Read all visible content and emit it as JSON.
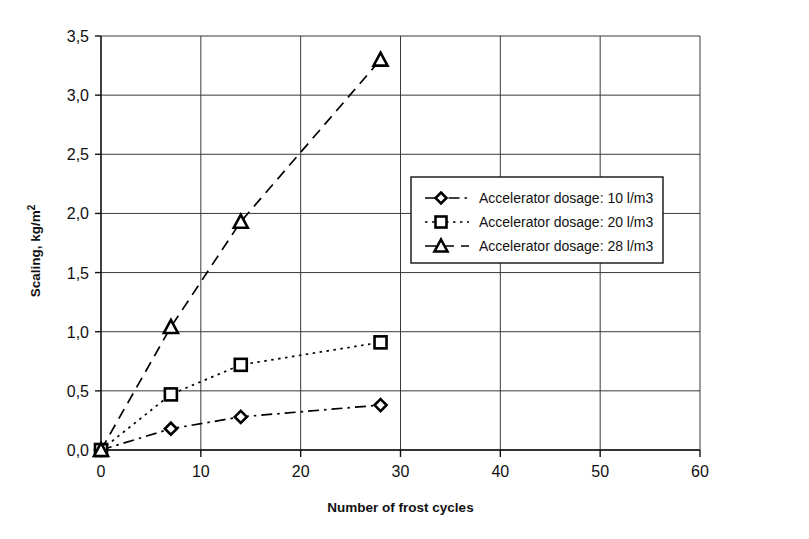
{
  "chart_data": {
    "type": "line",
    "title": "",
    "xlabel": "Number of frost cycles",
    "ylabel": "Scaling, kg/m2",
    "ylabel_display": "Scaling, kg/m",
    "ylabel_superscript": "2",
    "xlim": [
      0,
      60
    ],
    "ylim": [
      0.0,
      3.5
    ],
    "xticks": [
      0,
      10,
      20,
      30,
      40,
      50,
      60
    ],
    "xtick_labels": [
      "0",
      "10",
      "20",
      "30",
      "40",
      "50",
      "60"
    ],
    "yticks": [
      0.0,
      0.5,
      1.0,
      1.5,
      2.0,
      2.5,
      3.0,
      3.5
    ],
    "ytick_labels": [
      "0,0",
      "0,5",
      "1,0",
      "1,5",
      "2,0",
      "2,5",
      "3,0",
      "3,5"
    ],
    "decimal_separator": ",",
    "grid": "horizontal-and-vertical",
    "legend_position": "center-right-inside",
    "x": [
      0,
      7,
      14,
      28
    ],
    "series": [
      {
        "name": "Accelerator dosage: 10 l/m3",
        "marker": "diamond",
        "linestyle": "dash-dot",
        "color": "#000000",
        "values": [
          0.0,
          0.18,
          0.28,
          0.38
        ]
      },
      {
        "name": "Accelerator dosage: 20 l/m3",
        "marker": "square",
        "linestyle": "dotted",
        "color": "#000000",
        "values": [
          0.0,
          0.47,
          0.72,
          0.91
        ]
      },
      {
        "name": "Accelerator dosage: 28 l/m3",
        "marker": "triangle",
        "linestyle": "dashed",
        "color": "#000000",
        "values": [
          0.0,
          1.04,
          1.93,
          3.3
        ]
      }
    ]
  },
  "legend": {
    "entries": [
      {
        "label": "Accelerator dosage: 10 l/m3",
        "marker": "diamond",
        "linestyle": "dash-dot"
      },
      {
        "label": "Accelerator dosage: 20 l/m3",
        "marker": "square",
        "linestyle": "dotted"
      },
      {
        "label": "Accelerator dosage: 28 l/m3",
        "marker": "triangle",
        "linestyle": "dashed"
      }
    ]
  },
  "axes": {
    "x_title": "Number of frost cycles",
    "y_title_main": "Scaling, kg/m",
    "y_title_sup": "2"
  }
}
